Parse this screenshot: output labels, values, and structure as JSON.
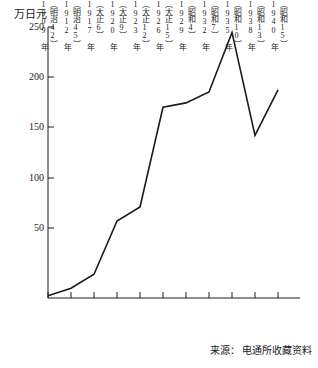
{
  "chart_data": {
    "type": "line",
    "title": "",
    "ylabel": "万日元",
    "xlabel": "",
    "ylim": [
      0,
      250
    ],
    "yticks": [
      50,
      100,
      150,
      200,
      250
    ],
    "ytick_labels": [
      "50",
      "100",
      "150",
      "200",
      "250"
    ],
    "grid": false,
    "legend": false,
    "categories": [
      "1909 年\n（明治42）",
      "1912 年\n（明治45）",
      "1917 年\n（大正6）",
      "1920 年\n（大正9）",
      "1923 年\n（大正12）",
      "1926 年\n（大正15）",
      "1929 年\n（昭和4）",
      "1932 年\n（昭和7）",
      "1935 年\n（昭和10）",
      "1938 年\n（昭和13）",
      "1940 年\n（昭和15）"
    ],
    "x_labels": [
      {
        "year": "1909 年",
        "era": "（明治42）"
      },
      {
        "year": "1912 年",
        "era": "（明治45）"
      },
      {
        "year": "1917 年",
        "era": "（大正6）"
      },
      {
        "year": "1920 年",
        "era": "（大正9）"
      },
      {
        "year": "1923 年",
        "era": "（大正12）"
      },
      {
        "year": "1926 年",
        "era": "（大正15）"
      },
      {
        "year": "1929 年",
        "era": "（昭和4）"
      },
      {
        "year": "1932 年",
        "era": "（昭和7）"
      },
      {
        "year": "1935 年",
        "era": "（昭和10）"
      },
      {
        "year": "1938 年",
        "era": "（昭和13）"
      },
      {
        "year": "1940 年",
        "era": "（昭和15）"
      }
    ],
    "values": [
      2,
      9,
      22,
      71,
      84,
      176,
      180,
      190,
      245,
      150,
      192
    ],
    "series": [
      {
        "name": "广告费",
        "values": [
          2,
          9,
          22,
          71,
          84,
          176,
          180,
          190,
          245,
          150,
          192
        ]
      }
    ],
    "line_color": "#1a1a1a"
  },
  "source": {
    "label": "来源：",
    "text": "电通所收藏资料",
    "full": "来源： 电通所收藏资料"
  }
}
